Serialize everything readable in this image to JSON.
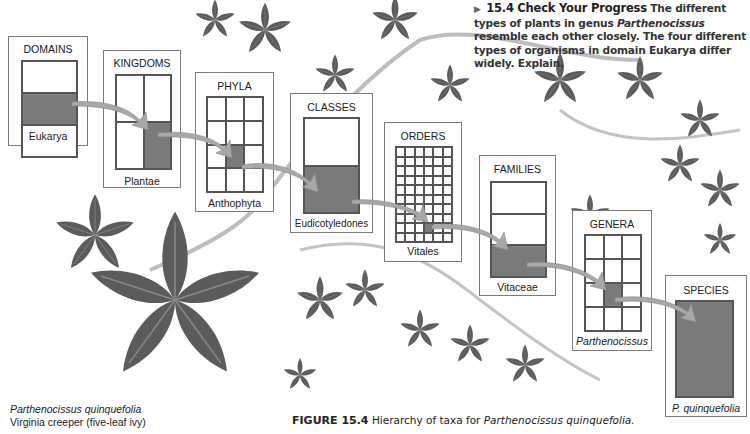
{
  "check_your_progress": {
    "number": "15.4",
    "title": "Check Your Progress",
    "text_part1": "The different types of plants in genus",
    "genus_italic": "Parthenocissus",
    "text_part2": "resemble each other closely. The four different types of organisms in domain Eukarya differ widely. Explain."
  },
  "taxa": [
    {
      "rank": "DOMAINS",
      "name": "Eukarya"
    },
    {
      "rank": "KINGDOMS",
      "name": "Plantae"
    },
    {
      "rank": "PHYLA",
      "name": "Anthophyta"
    },
    {
      "rank": "CLASSES",
      "name": "Eudicotyledones"
    },
    {
      "rank": "ORDERS",
      "name": "Vitales"
    },
    {
      "rank": "FAMILIES",
      "name": "Vitaceae"
    },
    {
      "rank": "GENERA",
      "name": "Parthenocissus"
    },
    {
      "rank": "SPECIES",
      "name": "P. quinquefolia"
    }
  ],
  "plant_caption": {
    "scientific_name": "Parthenocissus quinquefolia",
    "common_name": "Virginia creeper (five-leaf ivy)"
  },
  "figure": {
    "label": "FIGURE 15.4",
    "text": "Hierarchy of taxa for",
    "italic": "Parthenocissus quinquefolia."
  },
  "colors": {
    "selected_cell": "#7a7a7a",
    "arrow": "#a8a8a8",
    "leaf": "#5a5a5a"
  }
}
